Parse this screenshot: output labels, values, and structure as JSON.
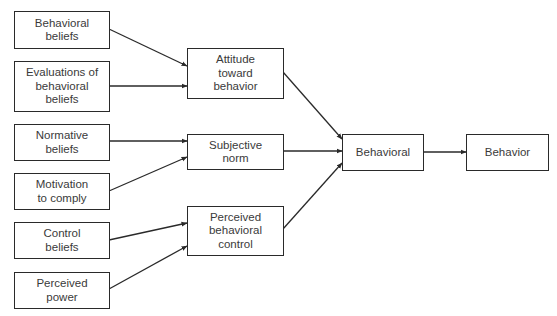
{
  "diagram": {
    "type": "flowchart",
    "nodes": {
      "behavioral_beliefs": "Behavioral\nbeliefs",
      "evaluations": "Evaluations of\nbehavioral\nbeliefs",
      "normative_beliefs": "Normative\nbeliefs",
      "motivation": "Motivation\nto comply",
      "control_beliefs": "Control\nbeliefs",
      "perceived_power": "Perceived\npower",
      "attitude": "Attitude\ntoward\nbehavior",
      "subjective_norm": "Subjective\nnorm",
      "pbc": "Perceived\nbehavioral\ncontrol",
      "behavioral": "Behavioral",
      "behavior": "Behavior"
    },
    "edges": [
      {
        "from": "behavioral_beliefs",
        "to": "attitude"
      },
      {
        "from": "evaluations",
        "to": "attitude"
      },
      {
        "from": "normative_beliefs",
        "to": "subjective_norm"
      },
      {
        "from": "motivation",
        "to": "subjective_norm"
      },
      {
        "from": "control_beliefs",
        "to": "pbc"
      },
      {
        "from": "perceived_power",
        "to": "pbc"
      },
      {
        "from": "attitude",
        "to": "behavioral"
      },
      {
        "from": "subjective_norm",
        "to": "behavioral"
      },
      {
        "from": "pbc",
        "to": "behavioral"
      },
      {
        "from": "behavioral",
        "to": "behavior"
      }
    ],
    "colors": {
      "stroke": "#2a2a2a",
      "text": "#3a3a3a",
      "background": "#ffffff"
    }
  }
}
